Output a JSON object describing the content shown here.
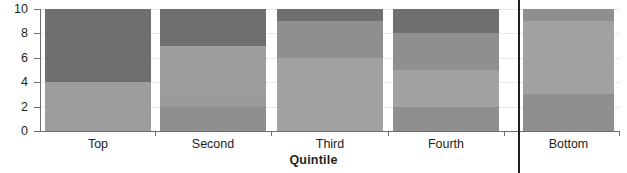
{
  "chart_data": {
    "type": "bar",
    "stacked": true,
    "title": "",
    "xlabel": "Quintile",
    "ylabel": "",
    "categories": [
      "Top",
      "Second",
      "Third",
      "Fourth",
      "Bottom"
    ],
    "ylim": [
      0,
      10
    ],
    "yticks": [
      0,
      2,
      4,
      6,
      8,
      10
    ],
    "ytick_labels": [
      "0",
      "2",
      "4",
      "6",
      "8",
      "10"
    ],
    "grid": true,
    "legend": "none",
    "series": [
      {
        "name": "segment-1",
        "note": "bottom-most stacked segment of each bar",
        "values": [
          4,
          2,
          6,
          2,
          3
        ]
      },
      {
        "name": "segment-2",
        "values": [
          6,
          1,
          3,
          3,
          6
        ]
      },
      {
        "name": "segment-3",
        "values": [
          0,
          4,
          1,
          3,
          1
        ]
      },
      {
        "name": "segment-4",
        "values": [
          0,
          3,
          0,
          2,
          0
        ]
      }
    ],
    "bars": [
      {
        "category": "Top",
        "total": 10,
        "segments": [
          {
            "from": 0,
            "to": 4,
            "value": 4,
            "color": "#9d9d9d"
          },
          {
            "from": 4,
            "to": 10,
            "value": 6,
            "color": "#6f6f6f"
          }
        ]
      },
      {
        "category": "Second",
        "total": 10,
        "segments": [
          {
            "from": 0,
            "to": 2,
            "value": 2,
            "color": "#8f8f8f"
          },
          {
            "from": 2,
            "to": 3,
            "value": 1,
            "color": "#9a9a9a"
          },
          {
            "from": 3,
            "to": 7,
            "value": 4,
            "color": "#9d9d9d"
          },
          {
            "from": 7,
            "to": 10,
            "value": 3,
            "color": "#6f6f6f"
          }
        ]
      },
      {
        "category": "Third",
        "total": 10,
        "segments": [
          {
            "from": 0,
            "to": 6,
            "value": 6,
            "color": "#a2a2a2"
          },
          {
            "from": 6,
            "to": 9,
            "value": 3,
            "color": "#8f8f8f"
          },
          {
            "from": 9,
            "to": 10,
            "value": 1,
            "color": "#6f6f6f"
          }
        ]
      },
      {
        "category": "Fourth",
        "total": 10,
        "segments": [
          {
            "from": 0,
            "to": 2,
            "value": 2,
            "color": "#8f8f8f"
          },
          {
            "from": 2,
            "to": 5,
            "value": 3,
            "color": "#a2a2a2"
          },
          {
            "from": 5,
            "to": 8,
            "value": 3,
            "color": "#8f8f8f"
          },
          {
            "from": 8,
            "to": 10,
            "value": 2,
            "color": "#6f6f6f"
          }
        ]
      },
      {
        "category": "Bottom",
        "total": 10,
        "segments": [
          {
            "from": 0,
            "to": 3,
            "value": 3,
            "color": "#8f8f8f"
          },
          {
            "from": 3,
            "to": 9,
            "value": 6,
            "color": "#a2a2a2"
          },
          {
            "from": 9,
            "to": 10,
            "value": 1,
            "color": "#8f8f8f"
          }
        ]
      }
    ],
    "divider": {
      "before_category": "Bottom",
      "color": "#231f20"
    },
    "colors": {
      "dark_gray": "#6f6f6f",
      "mid_gray": "#8f8f8f",
      "light_gray": "#a2a2a2",
      "axis": "#6d6e71",
      "grid": "#e8e8e8",
      "text": "#231f20"
    }
  }
}
